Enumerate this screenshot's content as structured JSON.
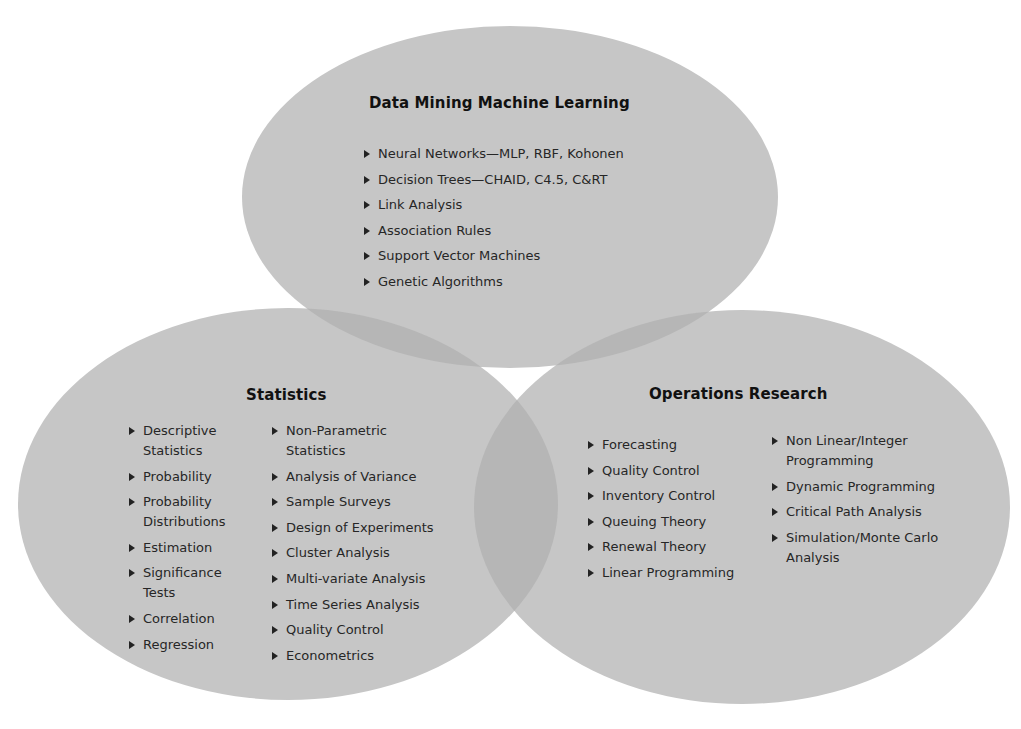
{
  "diagram": {
    "type": "venn",
    "fill_color": "#c6c6c6",
    "overlap_color": "#b4b4b4",
    "sets": [
      {
        "id": "dmml",
        "title": "Data Mining Machine Learning",
        "items": [
          "Neural Networks—MLP, RBF, Kohonen",
          "Decision Trees—CHAID, C4.5, C&RT",
          "Link Analysis",
          "Association Rules",
          "Support Vector Machines",
          "Genetic Algorithms"
        ]
      },
      {
        "id": "statistics",
        "title": "Statistics",
        "items_col1": [
          "Descriptive Statistics",
          "Probability",
          "Probability Distributions",
          "Estimation",
          "Significance Tests",
          "Correlation",
          "Regression"
        ],
        "items_col2": [
          "Non-Parametric Statistics",
          "Analysis of Variance",
          "Sample Surveys",
          "Design of Experiments",
          "Cluster Analysis",
          "Multi-variate Analysis",
          "Time Series Analysis",
          "Quality Control",
          "Econometrics"
        ]
      },
      {
        "id": "operations_research",
        "title": "Operations Research",
        "items_col1": [
          "Forecasting",
          "Quality Control",
          "Inventory Control",
          "Queuing Theory",
          "Renewal Theory",
          "Linear Programming"
        ],
        "items_col2": [
          "Non Linear/Integer Programming",
          "Dynamic Programming",
          "Critical Path Analysis",
          "Simulation/Monte Carlo Analysis"
        ]
      }
    ]
  }
}
